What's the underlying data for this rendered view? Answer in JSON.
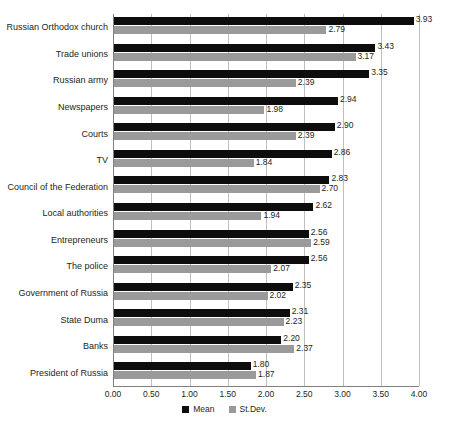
{
  "chart_data": {
    "type": "bar",
    "orientation": "horizontal",
    "title": "",
    "subtitle": "",
    "xlabel": "",
    "ylabel": "",
    "xlim": [
      0.0,
      4.0
    ],
    "xtick_step": 0.5,
    "grid": true,
    "legend_position": "bottom-center",
    "tick_labels": [
      "0.00",
      "0.50",
      "1.00",
      "1.50",
      "2.00",
      "2.50",
      "3.00",
      "3.50",
      "4.00"
    ],
    "categories": [
      "Russian Orthodox church",
      "Trade unions",
      "Russian army",
      "Newspapers",
      "Courts",
      "TV",
      "Council of the Federation",
      "Local authorities",
      "Entrepreneurs",
      "The police",
      "Government of Russia",
      "State Duma",
      "Banks",
      "President of Russia"
    ],
    "series": [
      {
        "name": "Mean",
        "color": "#0d0d0d",
        "values": [
          3.93,
          3.43,
          3.35,
          2.94,
          2.9,
          2.86,
          2.83,
          2.62,
          2.56,
          2.56,
          2.35,
          2.31,
          2.2,
          1.8
        ],
        "labels": [
          "3.93",
          "3.43",
          "3.35",
          "2.94",
          "2.90",
          "2.86",
          "2.83",
          "2.62",
          "2.56",
          "2.56",
          "2.35",
          "2.31",
          "2.20",
          "1.80"
        ]
      },
      {
        "name": "St.Dev.",
        "color": "#9a9a9a",
        "values": [
          2.79,
          3.17,
          2.39,
          1.98,
          2.39,
          1.84,
          2.7,
          1.94,
          2.59,
          2.07,
          2.02,
          2.23,
          2.37,
          1.87
        ],
        "labels": [
          "2.79",
          "3.17",
          "2.39",
          "1.98",
          "2.39",
          "1.84",
          "2.70",
          "1.94",
          "2.59",
          "2.07",
          "2.02",
          "2.23",
          "2.37",
          "1.87"
        ]
      }
    ]
  },
  "legend": {
    "entries": [
      {
        "label": "Mean"
      },
      {
        "label": "St.Dev."
      }
    ]
  }
}
